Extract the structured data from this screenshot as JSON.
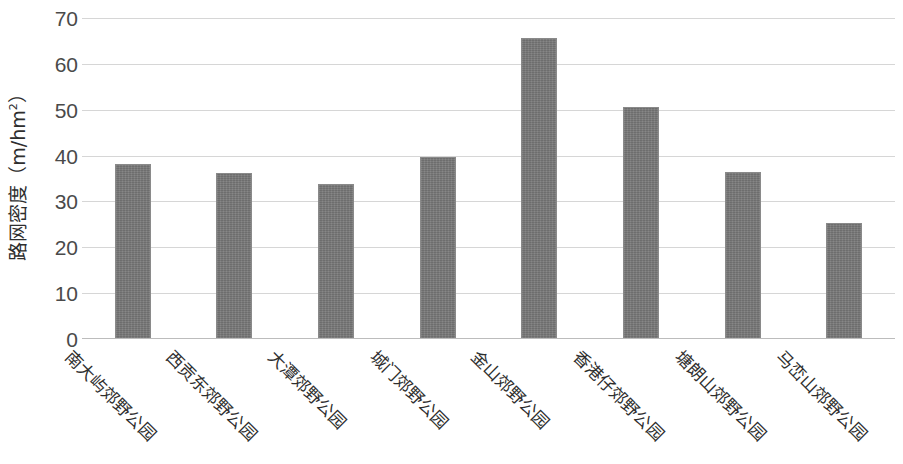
{
  "chart_data": {
    "type": "bar",
    "title": "",
    "xlabel": "",
    "ylabel": "路网密度（m/hm²）",
    "ylabel_main": "路网密度（m/hm",
    "ylabel_sup": "2",
    "ylabel_tail": "）",
    "ylim": [
      0,
      70
    ],
    "grid": true,
    "legend": "none",
    "bar_color": "#787878",
    "gridline_color": "#d6d6d6",
    "yticks": [
      70,
      60,
      50,
      40,
      30,
      20,
      10,
      0
    ],
    "ytick_labels": [
      "70",
      "60",
      "50",
      "40",
      "30",
      "20",
      "10",
      "0"
    ],
    "categories": [
      "南大屿郊野公园",
      "西贡东郊野公园",
      "大潭郊野公园",
      "城门郊野公园",
      "金山郊野公园",
      "香港仔郊野公园",
      "塘朗山郊野公园",
      "马峦山郊野公园"
    ],
    "values": [
      38.2,
      36.3,
      33.9,
      39.7,
      65.6,
      50.6,
      36.4,
      25.4
    ]
  }
}
